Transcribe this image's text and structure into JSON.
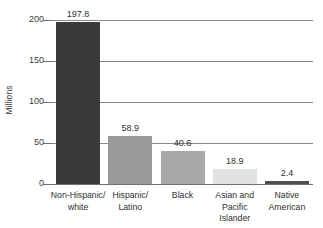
{
  "chart_data": {
    "type": "bar",
    "title": "",
    "subtitle": "",
    "xlabel": "",
    "ylabel": "Millions",
    "ylim": [
      0,
      200
    ],
    "yticks": [
      0,
      50,
      100,
      150,
      200
    ],
    "ytick_labels": [
      "0",
      "50",
      "100",
      "150",
      "200"
    ],
    "grid": true,
    "grid_axis": "y",
    "legend": false,
    "legend_position": "none",
    "categories": [
      "Non-Hispanic/\nwhite",
      "Hispanic/\nLatino",
      "Black",
      "Asian and\nPacific Islander",
      "Native\nAmerican"
    ],
    "values": [
      197.8,
      58.9,
      40.6,
      18.9,
      2.4
    ],
    "value_labels": [
      "197.8",
      "58.9",
      "40.6",
      "18.9",
      "2.4"
    ],
    "bar_colors": [
      "#3a3a3a",
      "#999999",
      "#a8a8a8",
      "#e2e2e2",
      "#4f4f4f"
    ],
    "axis_color": "#6f6f6f",
    "grid_color": "#8a8a8a",
    "text_color": "#2e2e2e",
    "background": "#ffffff"
  }
}
